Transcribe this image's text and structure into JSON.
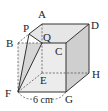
{
  "figure": {
    "type": "cube",
    "vertices": {
      "A": {
        "label": "A",
        "x": 42,
        "y": 24
      },
      "B": {
        "label": "B",
        "x": 18,
        "y": 43
      },
      "C": {
        "label": "C",
        "x": 66,
        "y": 43
      },
      "D": {
        "label": "D",
        "x": 89,
        "y": 24
      },
      "E": {
        "label": "E",
        "x": 42,
        "y": 73
      },
      "F": {
        "label": "F",
        "x": 18,
        "y": 92
      },
      "G": {
        "label": "G",
        "x": 66,
        "y": 92
      },
      "H": {
        "label": "H",
        "x": 89,
        "y": 73
      },
      "P": {
        "label": "P",
        "x": 29,
        "y": 34
      },
      "Q": {
        "label": "Q",
        "x": 42,
        "y": 43
      }
    },
    "dimension_label": "6 cm",
    "colors": {
      "top_face": "#e6e6e6",
      "front_face": "#ebebeb",
      "right_face": "#cfcfcf",
      "section_face": "#d8d8d8",
      "edge": "#333333"
    }
  }
}
